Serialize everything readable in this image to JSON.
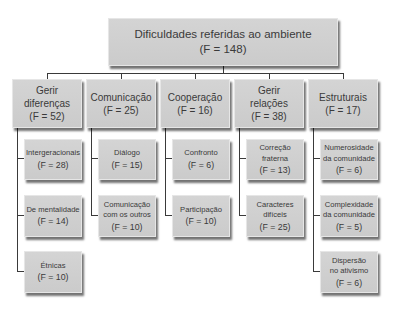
{
  "root": {
    "label": "Dificuldades referidas ao ambiente",
    "freq": "(F = 148)"
  },
  "categories": [
    {
      "label_line1": "Gerir",
      "label_line2": "diferenças",
      "freq": "(F = 52)",
      "children": [
        {
          "line1": "Intergeracionais",
          "line2": "",
          "freq": "(F = 28)"
        },
        {
          "line1": "De mentalidade",
          "line2": "",
          "freq": "(F = 14)"
        },
        {
          "line1": "Étnicas",
          "line2": "",
          "freq": "(F = 10)"
        }
      ]
    },
    {
      "label_line1": "Comunicação",
      "label_line2": "",
      "freq": "(F = 25)",
      "children": [
        {
          "line1": "Diálogo",
          "line2": "",
          "freq": "(F = 15)"
        },
        {
          "line1": "Comunicação",
          "line2": "com os outros",
          "freq": "(F = 10)"
        }
      ]
    },
    {
      "label_line1": "Cooperação",
      "label_line2": "",
      "freq": "(F = 16)",
      "children": [
        {
          "line1": "Confronto",
          "line2": "",
          "freq": "(F = 6)"
        },
        {
          "line1": "Participação",
          "line2": "",
          "freq": "(F = 10)"
        }
      ]
    },
    {
      "label_line1": "Gerir",
      "label_line2": "relações",
      "freq": "(F = 38)",
      "children": [
        {
          "line1": "Correção",
          "line2": "fraterna",
          "freq": "(F = 13)"
        },
        {
          "line1": "Caracteres",
          "line2": "difíceis",
          "freq": "(F = 25)"
        }
      ]
    },
    {
      "label_line1": "Estruturais",
      "label_line2": "",
      "freq": "(F = 17)",
      "children": [
        {
          "line1": "Numerosidade",
          "line2": "da comunidade",
          "freq": "(F = 6)"
        },
        {
          "line1": "Complexidade",
          "line2": "da comunidade",
          "freq": "(F = 5)"
        },
        {
          "line1": "Dispersão",
          "line2": "no ativismo",
          "freq": "(F = 6)"
        }
      ]
    }
  ],
  "colors": {
    "box_fill": "#cfcfcf",
    "line": "#3a3a3a",
    "text": "#3a3a3a"
  }
}
